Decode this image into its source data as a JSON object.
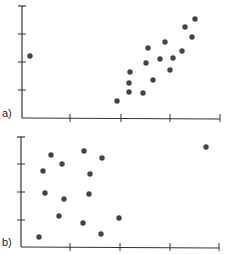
{
  "chart_data": [
    {
      "type": "scatter",
      "panel_label": "a)",
      "title": "",
      "xlabel": "",
      "ylabel": "",
      "grid": false,
      "axis_px": {
        "x0": 22,
        "y0": 118,
        "x1": 220,
        "ytop": 6
      },
      "xticks_px": [
        70,
        121,
        170,
        220
      ],
      "yticks_px": [
        34,
        62,
        90
      ],
      "points_px": [
        [
          30,
          56
        ],
        [
          117,
          101
        ],
        [
          129,
          92
        ],
        [
          129,
          83
        ],
        [
          130,
          72
        ],
        [
          143,
          93
        ],
        [
          146,
          63
        ],
        [
          148,
          48
        ],
        [
          153,
          80
        ],
        [
          160,
          59
        ],
        [
          165,
          42
        ],
        [
          170,
          70
        ],
        [
          173,
          58
        ],
        [
          182,
          51
        ],
        [
          185,
          27
        ],
        [
          192,
          37
        ],
        [
          195,
          19
        ]
      ]
    },
    {
      "type": "scatter",
      "panel_label": "b)",
      "title": "",
      "xlabel": "",
      "ylabel": "",
      "grid": false,
      "axis_px": {
        "x0": 21,
        "y0": 247,
        "x1": 219,
        "ytop": 137
      },
      "xticks_px": [
        70,
        120,
        170,
        219
      ],
      "yticks_px": [
        164,
        192,
        220
      ],
      "points_px": [
        [
          51,
          155
        ],
        [
          84,
          151
        ],
        [
          102,
          158
        ],
        [
          206,
          147
        ],
        [
          43,
          171
        ],
        [
          62,
          164
        ],
        [
          90,
          174
        ],
        [
          45,
          193
        ],
        [
          64,
          199
        ],
        [
          89,
          194
        ],
        [
          59,
          216
        ],
        [
          83,
          223
        ],
        [
          119,
          218
        ],
        [
          39,
          237
        ],
        [
          101,
          234
        ]
      ]
    }
  ],
  "style": {
    "axis_color": "#333333",
    "point_color": "#444444"
  }
}
